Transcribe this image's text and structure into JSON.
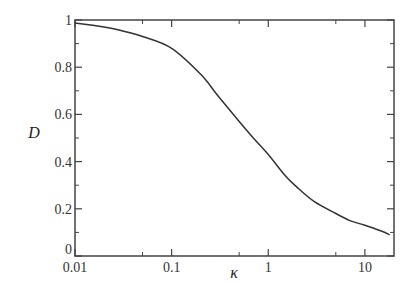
{
  "chart_data": {
    "type": "line",
    "title": "",
    "xlabel": "κ",
    "ylabel": "D",
    "xscale": "log",
    "xlim": [
      0.01,
      20
    ],
    "ylim": [
      0,
      1
    ],
    "grid": false,
    "legend": null,
    "x_ticks": [
      {
        "value": 0.01,
        "label": "0.01"
      },
      {
        "value": 0.1,
        "label": "0.1"
      },
      {
        "value": 1,
        "label": "1"
      },
      {
        "value": 10,
        "label": "10"
      }
    ],
    "x_minor_ticks": [
      0.05,
      0.5,
      5
    ],
    "y_ticks": [
      {
        "value": 0,
        "label": "0"
      },
      {
        "value": 0.2,
        "label": "0.2"
      },
      {
        "value": 0.4,
        "label": "0.4"
      },
      {
        "value": 0.6,
        "label": "0.6"
      },
      {
        "value": 0.8,
        "label": "0.8"
      },
      {
        "value": 1,
        "label": "1"
      }
    ],
    "y_minor_ticks": [
      0.1,
      0.3,
      0.5,
      0.7,
      0.9
    ],
    "series": [
      {
        "name": "D(κ)",
        "color": "#333333",
        "x": [
          0.01,
          0.02,
          0.03,
          0.05,
          0.1,
          0.2,
          0.3,
          0.5,
          0.7,
          1,
          1.5,
          2,
          3,
          5,
          7,
          10,
          15,
          18
        ],
        "y": [
          0.987,
          0.97,
          0.955,
          0.93,
          0.88,
          0.77,
          0.68,
          0.57,
          0.5,
          0.43,
          0.34,
          0.29,
          0.23,
          0.18,
          0.15,
          0.13,
          0.105,
          0.09
        ]
      }
    ]
  }
}
